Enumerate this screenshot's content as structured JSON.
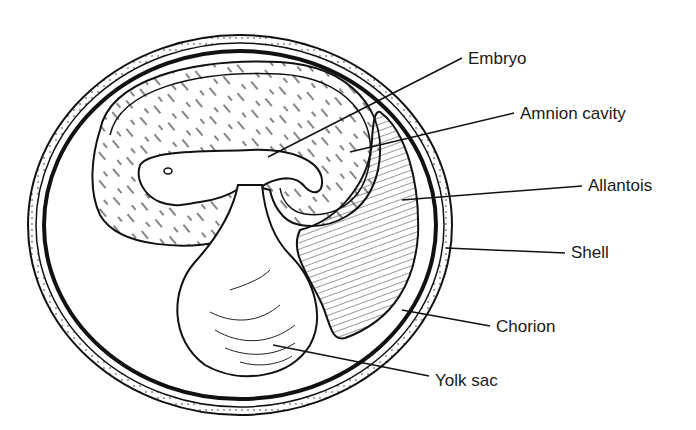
{
  "colors": {
    "ink": "#111111",
    "background": "#ffffff"
  },
  "labels": [
    {
      "id": "embryo",
      "text": "Embryo",
      "x": 468,
      "y": 50
    },
    {
      "id": "amnion-cavity",
      "text": "Amnion cavity",
      "x": 520,
      "y": 105
    },
    {
      "id": "allantois",
      "text": "Allantois",
      "x": 588,
      "y": 177
    },
    {
      "id": "shell",
      "text": "Shell",
      "x": 571,
      "y": 244
    },
    {
      "id": "chorion",
      "text": "Chorion",
      "x": 496,
      "y": 318
    },
    {
      "id": "yolk-sac",
      "text": "Yolk sac",
      "x": 435,
      "y": 372
    }
  ]
}
